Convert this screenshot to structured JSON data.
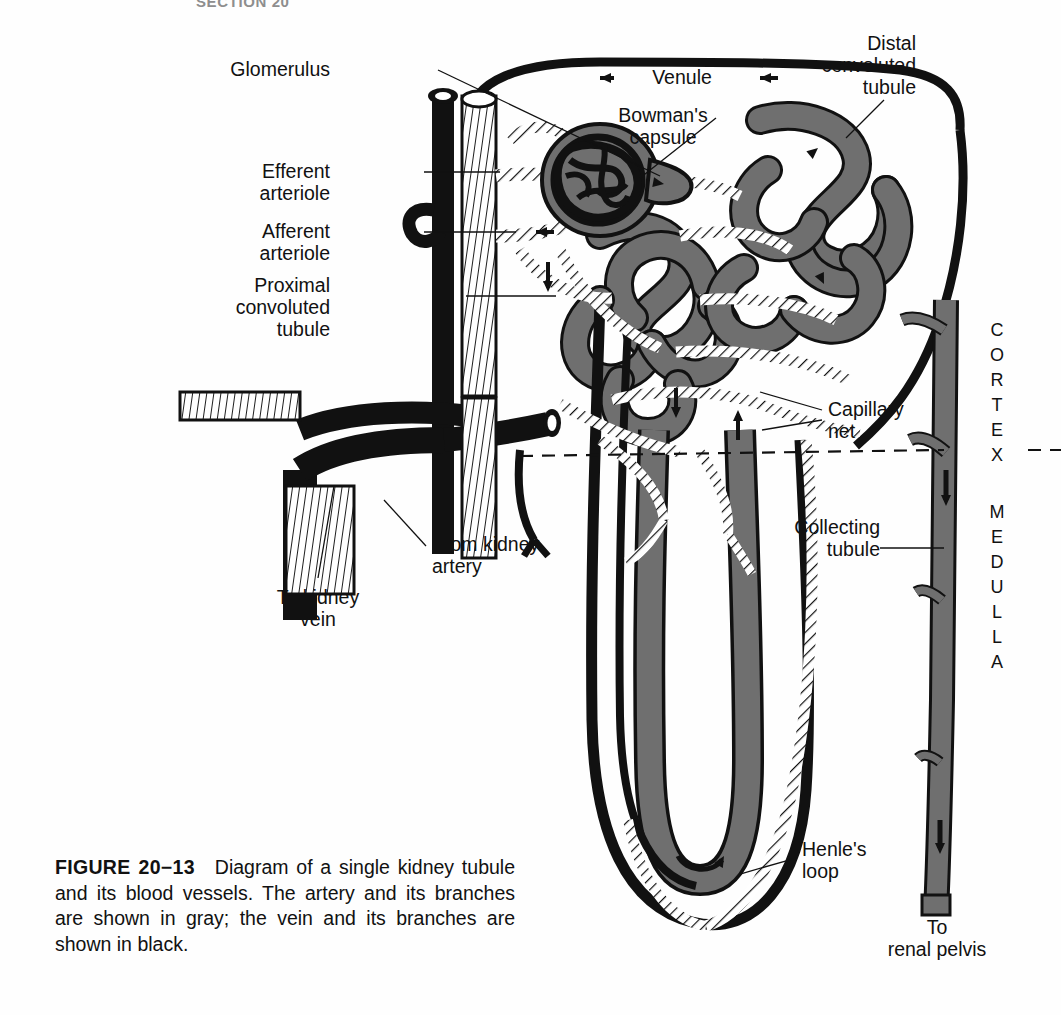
{
  "page": {
    "running_head": "SECTION 20",
    "background": "#fefefe",
    "width": 1061,
    "height": 1015
  },
  "figure": {
    "number": "FIGURE 20−13",
    "caption_text": "Diagram of a single kidney tubule and its blood vessels. The artery and its branches are shown in gray; the vein and its branches are shown in black.",
    "colors": {
      "artery_gray": "#6f6f6f",
      "vein_black": "#111111",
      "outline": "#111111",
      "paper": "#fefefe"
    }
  },
  "labels": {
    "glomerulus": "Glomerulus",
    "bowmans_capsule": "Bowman's\ncapsule",
    "efferent_arteriole": "Efferent\narteriole",
    "afferent_arteriole": "Afferent\narteriole",
    "proximal_convoluted_tubule": "Proximal\nconvoluted\ntubule",
    "distal_convoluted_tubule": "Distal\nconvoluted\ntubule",
    "venule": "Venule",
    "capillary_net": "Capillary\nnet",
    "collecting_tubule": "Collecting\ntubule",
    "henles_loop": "Henle's\nloop",
    "from_kidney_artery": "From kidney\nartery",
    "to_kidney_vein": "To kidney\nvein",
    "to_renal_pelvis": "To\nrenal pelvis"
  },
  "regions": {
    "cortex": "CORTEX",
    "medulla": "MEDULLA",
    "boundary_style": "dashed"
  },
  "flow_arrows": [
    {
      "name": "venule-arrow-left",
      "direction": "left"
    },
    {
      "name": "venule-arrow-right",
      "direction": "left"
    },
    {
      "name": "distal-tubule-arrow",
      "direction": "down-right"
    },
    {
      "name": "proximal-tubule-arrow",
      "direction": "down"
    },
    {
      "name": "capillary-arrow-down",
      "direction": "down"
    },
    {
      "name": "capillary-arrow-up",
      "direction": "up"
    },
    {
      "name": "collecting-tubule-arrow-upper",
      "direction": "down"
    },
    {
      "name": "collecting-tubule-arrow-lower",
      "direction": "down"
    },
    {
      "name": "henle-loop-arrow",
      "direction": "curved-right"
    }
  ]
}
